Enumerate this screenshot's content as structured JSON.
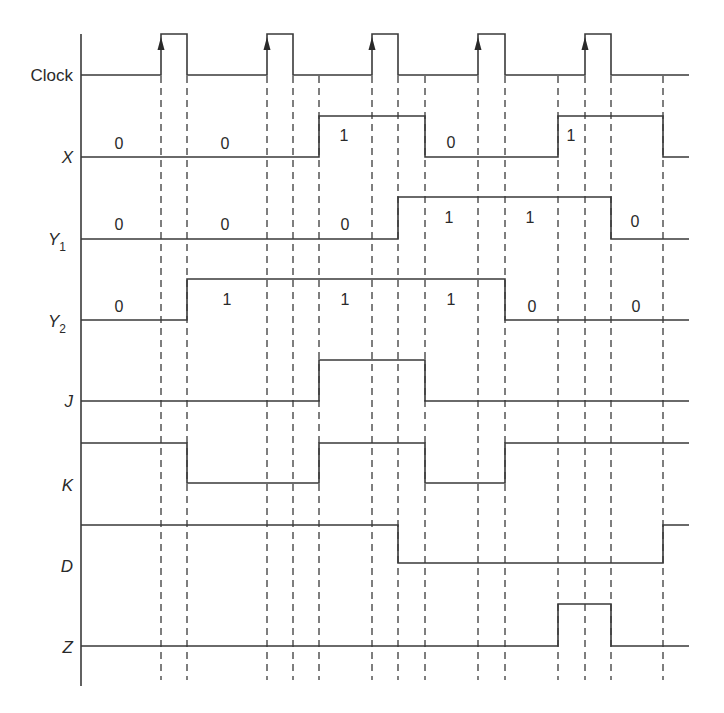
{
  "diagram": {
    "type": "timing-diagram",
    "axis": {
      "x": 81,
      "top": 34,
      "bottom": 686
    },
    "x_end": 689,
    "dashed_lines": {
      "x": [
        161,
        187,
        267,
        293,
        319,
        372,
        398,
        425,
        478,
        505,
        558,
        585,
        611,
        663
      ],
      "top": 76,
      "bottom": 680
    },
    "clock_edges": [
      {
        "rise": 161,
        "fall": 187
      },
      {
        "rise": 267,
        "fall": 293
      },
      {
        "rise": 372,
        "fall": 398
      },
      {
        "rise": 478,
        "fall": 505
      },
      {
        "rise": 585,
        "fall": 611
      }
    ],
    "signals": [
      {
        "id": "clock",
        "label": "Clock",
        "sub": "",
        "italic": false,
        "label_y": 81,
        "low_y": 75,
        "high_y": 34,
        "initial": 0,
        "transitions": [
          161,
          187,
          267,
          293,
          372,
          398,
          478,
          505,
          585,
          611
        ],
        "values": []
      },
      {
        "id": "x",
        "label": "X",
        "sub": "",
        "italic": true,
        "label_y": 163,
        "low_y": 157,
        "high_y": 116,
        "initial": 0,
        "transitions": [
          319,
          425,
          558,
          663
        ],
        "values": [
          {
            "text": "0",
            "x": 119,
            "y": 149
          },
          {
            "text": "0",
            "x": 225,
            "y": 149
          },
          {
            "text": "1",
            "x": 344,
            "y": 141
          },
          {
            "text": "0",
            "x": 451,
            "y": 148
          },
          {
            "text": "1",
            "x": 571,
            "y": 141
          }
        ]
      },
      {
        "id": "y1",
        "label": "Y",
        "sub": "1",
        "italic": true,
        "label_y": 245,
        "low_y": 239,
        "high_y": 197,
        "initial": 0,
        "transitions": [
          398,
          611
        ],
        "values": [
          {
            "text": "0",
            "x": 119,
            "y": 230
          },
          {
            "text": "0",
            "x": 225,
            "y": 230
          },
          {
            "text": "0",
            "x": 345,
            "y": 230
          },
          {
            "text": "1",
            "x": 449,
            "y": 223
          },
          {
            "text": "1",
            "x": 530,
            "y": 223
          },
          {
            "text": "0",
            "x": 635,
            "y": 227
          }
        ]
      },
      {
        "id": "y2",
        "label": "Y",
        "sub": "2",
        "italic": true,
        "label_y": 327,
        "low_y": 320,
        "high_y": 279,
        "initial": 0,
        "transitions": [
          187,
          505
        ],
        "values": [
          {
            "text": "0",
            "x": 119,
            "y": 312
          },
          {
            "text": "1",
            "x": 227,
            "y": 305
          },
          {
            "text": "1",
            "x": 345,
            "y": 305
          },
          {
            "text": "1",
            "x": 451,
            "y": 305
          },
          {
            "text": "0",
            "x": 532,
            "y": 312
          },
          {
            "text": "0",
            "x": 636,
            "y": 312
          }
        ]
      },
      {
        "id": "j",
        "label": "J",
        "sub": "",
        "italic": true,
        "label_y": 407,
        "low_y": 401,
        "high_y": 360,
        "initial": 0,
        "transitions": [
          319,
          425
        ],
        "values": []
      },
      {
        "id": "k",
        "label": "K",
        "sub": "",
        "italic": true,
        "label_y": 491,
        "low_y": 483,
        "high_y": 443,
        "initial": 1,
        "transitions": [
          187,
          319,
          425,
          505
        ],
        "values": []
      },
      {
        "id": "d",
        "label": "D",
        "sub": "",
        "italic": true,
        "label_y": 572,
        "low_y": 563,
        "high_y": 525,
        "initial": 1,
        "transitions": [
          398,
          663
        ],
        "values": []
      },
      {
        "id": "z",
        "label": "Z",
        "sub": "",
        "italic": true,
        "label_y": 653,
        "low_y": 646,
        "high_y": 604,
        "initial": 0,
        "transitions": [
          558,
          611
        ],
        "values": []
      }
    ]
  }
}
